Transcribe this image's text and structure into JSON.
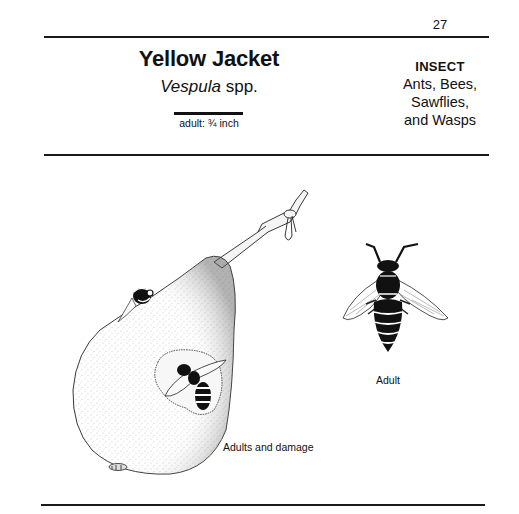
{
  "header": {
    "page_number": "27"
  },
  "species": {
    "common_name": "Yellow Jacket",
    "scientific_genus": "Vespula",
    "scientific_suffix": " spp.",
    "size_label": "adult: ¾ inch"
  },
  "classification": {
    "type": "INSECT",
    "group_lines": [
      "Ants, Bees,",
      "Sawflies,",
      "and Wasps"
    ]
  },
  "illustrations": [
    {
      "subject": "pear-with-wasps",
      "caption": "Adults and damage"
    },
    {
      "subject": "adult-wasp",
      "caption": "Adult"
    }
  ],
  "colors": {
    "ink": "#111111",
    "paper": "#ffffff",
    "stipple": "#8a8a8a"
  }
}
